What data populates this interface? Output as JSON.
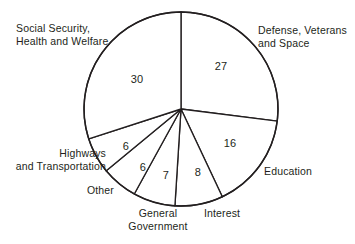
{
  "chart_data": {
    "type": "pie",
    "title": "",
    "subtitle": "",
    "xlabel": "",
    "ylabel": "",
    "legend_position": "none",
    "grid": false,
    "total": 100,
    "units": "percent",
    "start_angle_deg": 0,
    "direction": "clockwise",
    "center": {
      "x": 181,
      "y": 109
    },
    "radius": 97,
    "colors": {
      "slice_fill": "#ffffff",
      "outline": "#231f20",
      "text": "#231f20",
      "background": "#ffffff"
    },
    "categories": [
      "Defense, Veterans and Space",
      "Education",
      "Interest",
      "General Government",
      "Other",
      "Highways and Transportation",
      "Social Security, Health and Welfare"
    ],
    "values": [
      27,
      16,
      8,
      7,
      6,
      6,
      30
    ],
    "slices": [
      {
        "name": "Defense, Veterans and Space",
        "value": 27,
        "value_text": "27",
        "label_line1": "Defense, Veterans",
        "label_line2": "and Space",
        "start_deg": 0,
        "end_deg": 97.2,
        "value_x": 221,
        "value_y": 66,
        "label_x": 258,
        "label_y": 24,
        "label_anchor": "left"
      },
      {
        "name": "Education",
        "value": 16,
        "value_text": "16",
        "label_line1": "Education",
        "label_line2": "",
        "start_deg": 97.2,
        "end_deg": 154.8,
        "value_x": 230,
        "value_y": 143,
        "label_x": 264,
        "label_y": 165,
        "label_anchor": "left"
      },
      {
        "name": "Interest",
        "value": 8,
        "value_text": "8",
        "label_line1": "Interest",
        "label_line2": "",
        "start_deg": 154.8,
        "end_deg": 183.6,
        "value_x": 198,
        "value_y": 172,
        "label_x": 222,
        "label_y": 207,
        "label_anchor": "center"
      },
      {
        "name": "General Government",
        "value": 7,
        "value_text": "7",
        "label_line1": "General",
        "label_line2": "Government",
        "start_deg": 183.6,
        "end_deg": 208.8,
        "value_x": 166,
        "value_y": 175,
        "label_x": 158,
        "label_y": 207,
        "label_anchor": "center"
      },
      {
        "name": "Other",
        "value": 6,
        "value_text": "6",
        "label_line1": "Other",
        "label_line2": "",
        "start_deg": 208.8,
        "end_deg": 230.4,
        "value_x": 143,
        "value_y": 167,
        "label_x": 114,
        "label_y": 184,
        "label_anchor": "right"
      },
      {
        "name": "Highways and Transportation",
        "value": 6,
        "value_text": "6",
        "label_line1": "Highways",
        "label_line2": "and Transportation",
        "start_deg": 230.4,
        "end_deg": 252.0,
        "value_x": 126,
        "value_y": 146,
        "label_x": 106,
        "label_y": 147,
        "label_anchor": "right"
      },
      {
        "name": "Social Security, Health and Welfare",
        "value": 30,
        "value_text": "30",
        "label_line1": "Social Security,",
        "label_line2": "Health and Welfare",
        "start_deg": 252.0,
        "end_deg": 360.0,
        "value_x": 137,
        "value_y": 79,
        "label_x": 16,
        "label_y": 22,
        "label_anchor": "left"
      }
    ]
  }
}
